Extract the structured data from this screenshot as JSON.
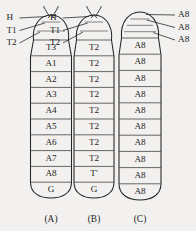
{
  "figure": {
    "background_color": "#f2f1ef",
    "line_color": "#242424",
    "panels": [
      {
        "id": "A",
        "caption": "(A)",
        "has_antennae": true,
        "leader_labels": [
          "H",
          "T1",
          "T2"
        ],
        "leader_side": "left",
        "unlabeled_top_bands": 2,
        "segments": [
          "T3",
          "A1",
          "A2",
          "A3",
          "A4",
          "A5",
          "A6",
          "A7",
          "A8",
          "G"
        ]
      },
      {
        "id": "B",
        "caption": "(B)",
        "has_antennae": true,
        "leader_labels": [
          "H",
          "T1",
          "T2"
        ],
        "leader_side": "left",
        "unlabeled_top_bands": 2,
        "segments": [
          "T2",
          "T2",
          "T2",
          "T2",
          "T2",
          "T2",
          "T2",
          "T2",
          "T'",
          "G"
        ]
      },
      {
        "id": "C",
        "caption": "(C)",
        "has_antennae": false,
        "leader_labels": [
          "A8",
          "A8",
          "A8"
        ],
        "leader_side": "right",
        "unlabeled_top_bands": 3,
        "segments": [
          "A8",
          "A8",
          "A8",
          "A8",
          "A8",
          "A8",
          "A8",
          "A8",
          "A8",
          "A8"
        ]
      }
    ]
  }
}
